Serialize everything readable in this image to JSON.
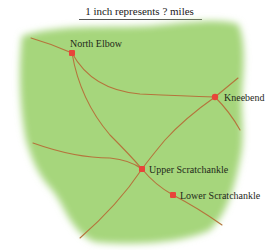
{
  "title": "1 inch represents ? miles",
  "colors": {
    "land": "#a6d67c",
    "road": "#b5743c",
    "town": "#e8453a",
    "text": "#1f2a1a"
  },
  "towns": [
    {
      "name": "North Elbow",
      "x": 72,
      "y": 53
    },
    {
      "name": "Kneebend",
      "x": 215,
      "y": 97
    },
    {
      "name": "Upper Scratchankle",
      "x": 142,
      "y": 169
    },
    {
      "name": "Lower Scratchankle",
      "x": 173,
      "y": 195
    }
  ],
  "labels": {
    "north_elbow": "North Elbow",
    "kneebend": "Kneebend",
    "upper_scratchankle": "Upper Scratchankle",
    "lower_scratchankle": "Lower Scratchankle"
  }
}
